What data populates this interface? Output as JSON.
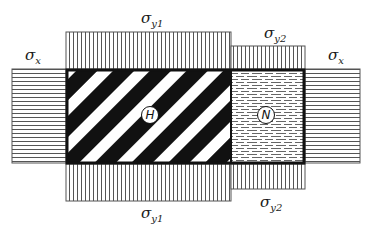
{
  "diagram": {
    "type": "stress-boundary-schematic",
    "regions": {
      "H": {
        "label": "H",
        "fill": "diagonal-stripes",
        "color": "#111111"
      },
      "N": {
        "label": "N",
        "fill": "dashed-horizontal",
        "color": "#111111"
      }
    },
    "stresses": {
      "sigma_x_left": {
        "symbol": "σ",
        "subscript": "x",
        "fill": "horizontal-lines"
      },
      "sigma_x_right": {
        "symbol": "σ",
        "subscript": "x",
        "fill": "horizontal-lines"
      },
      "sigma_y1_top": {
        "symbol": "σ",
        "subscript": "y1",
        "fill": "vertical-lines"
      },
      "sigma_y2_top": {
        "symbol": "σ",
        "subscript": "y2",
        "fill": "vertical-lines"
      },
      "sigma_y1_bottom": {
        "symbol": "σ",
        "subscript": "y1",
        "fill": "vertical-lines"
      },
      "sigma_y2_bottom": {
        "symbol": "σ",
        "subscript": "y2",
        "fill": "vertical-lines"
      }
    },
    "colors": {
      "ink": "#111111",
      "hatch": "#555555",
      "background": "#ffffff"
    }
  }
}
